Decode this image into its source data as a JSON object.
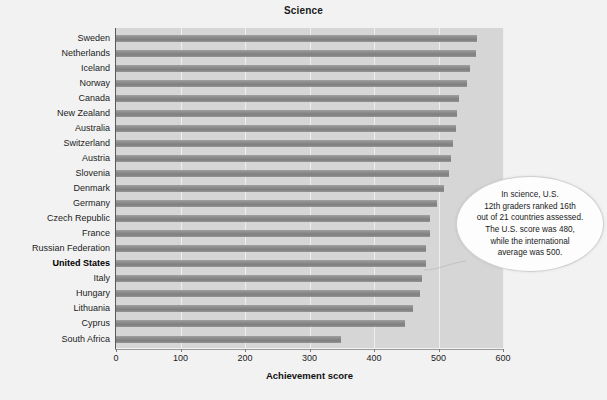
{
  "chart_data": {
    "type": "bar",
    "orientation": "horizontal",
    "title": "Science",
    "xlabel": "Achievement score",
    "ylabel": "",
    "xlim": [
      0,
      600
    ],
    "xticks": [
      0,
      100,
      200,
      300,
      400,
      500,
      600
    ],
    "xtick_labels": [
      "0",
      "100",
      "200",
      "300",
      "400",
      "500",
      "600"
    ],
    "grid": "vertical",
    "legend": "none",
    "bar_color": "#8c8c8c",
    "plot_background": "#d6d6d6",
    "highlight_category": "United States",
    "categories": [
      "Sweden",
      "Netherlands",
      "Iceland",
      "Norway",
      "Canada",
      "New Zealand",
      "Australia",
      "Switzerland",
      "Austria",
      "Slovenia",
      "Denmark",
      "Germany",
      "Czech Republic",
      "France",
      "Russian Federation",
      "United States",
      "Italy",
      "Hungary",
      "Lithuania",
      "Cyprus",
      "South Africa"
    ],
    "values": [
      559,
      558,
      549,
      544,
      532,
      529,
      527,
      523,
      520,
      517,
      509,
      497,
      487,
      487,
      481,
      480,
      475,
      471,
      461,
      448,
      349
    ]
  },
  "annotation": {
    "name": "us-science-callout",
    "lines": [
      "In science, U.S.",
      "12th graders ranked 16th",
      "out of 21 countries assessed.",
      "The U.S. score was 480,",
      "while the international",
      "average was 500."
    ],
    "text": "In science, U.S. 12th graders ranked 16th out of 21 countries assessed. The U.S. score was 480, while the international average was 500."
  }
}
